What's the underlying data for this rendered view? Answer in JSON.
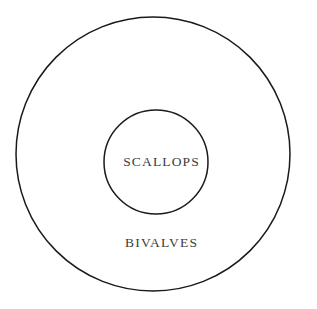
{
  "diagram": {
    "type": "euler-containment",
    "title": "",
    "background_color": "#ffffff",
    "stroke_color": "#1a1a1a",
    "text_color": "#3b3b3b",
    "sets": [
      {
        "id": "bivalves",
        "label": "BIVALVES",
        "role": "outer-set",
        "shape": "circle",
        "center_x": 153,
        "center_y": 154,
        "radius": 137,
        "stroke_width": 1.5,
        "fill": "none",
        "label_x": 161,
        "label_y": 243
      },
      {
        "id": "scallops",
        "label": "SCALLOPS",
        "role": "inner-subset",
        "shape": "circle",
        "center_x": 156,
        "center_y": 162,
        "radius": 52,
        "stroke_width": 1.5,
        "fill": "none",
        "label_x": 161,
        "label_y": 162
      }
    ],
    "relation": "SCALLOPS is a proper subset of BIVALVES"
  }
}
